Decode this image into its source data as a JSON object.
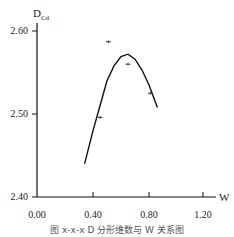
{
  "chart_data": {
    "type": "scatter",
    "title": "",
    "caption": "图 x-x-x  D 分形维数与 W 关系图",
    "xlabel": "W",
    "ylabel": "D_Cd",
    "ylabel_main": "D",
    "ylabel_sub": "Cd",
    "xlim": [
      0.0,
      1.3
    ],
    "ylim": [
      2.4,
      2.6
    ],
    "xticks": [
      "0.00",
      "0.40",
      "0.80",
      "1.20"
    ],
    "yticks": [
      "2.40",
      "2.50",
      "2.60"
    ],
    "grid": false,
    "legend": null,
    "series": [
      {
        "name": "observed",
        "kind": "scatter",
        "points": [
          {
            "x": 0.45,
            "y": 2.496
          },
          {
            "x": 0.51,
            "y": 2.587
          },
          {
            "x": 0.65,
            "y": 2.56
          },
          {
            "x": 0.81,
            "y": 2.525
          }
        ]
      },
      {
        "name": "quadratic fit",
        "kind": "line",
        "points": [
          {
            "x": 0.34,
            "y": 2.44
          },
          {
            "x": 0.4,
            "y": 2.48
          },
          {
            "x": 0.45,
            "y": 2.51
          },
          {
            "x": 0.5,
            "y": 2.54
          },
          {
            "x": 0.55,
            "y": 2.558
          },
          {
            "x": 0.6,
            "y": 2.569
          },
          {
            "x": 0.65,
            "y": 2.572
          },
          {
            "x": 0.7,
            "y": 2.566
          },
          {
            "x": 0.75,
            "y": 2.553
          },
          {
            "x": 0.8,
            "y": 2.535
          },
          {
            "x": 0.86,
            "y": 2.508
          }
        ]
      }
    ]
  }
}
